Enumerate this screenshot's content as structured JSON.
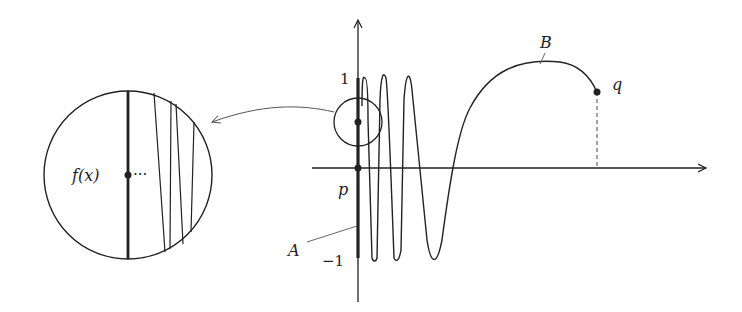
{
  "diagram": {
    "type": "topologist-sine-curve",
    "labels": {
      "y_tick_top": "1",
      "y_tick_bottom": "−1",
      "point_p": "p",
      "point_q": "q",
      "set_A": "A",
      "curve_B": "B",
      "zoom_label": "f(x)",
      "zoom_ellipsis": "···"
    },
    "colors": {
      "stroke": "#222222",
      "leader": "#666666"
    }
  }
}
